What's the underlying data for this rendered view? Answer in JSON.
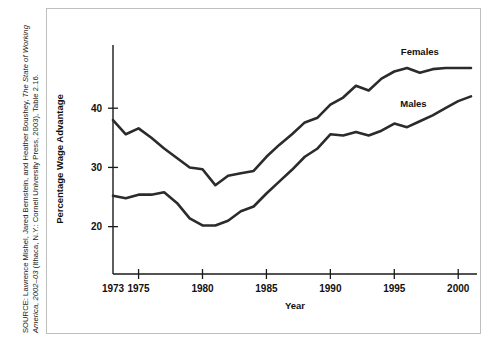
{
  "source_note": {
    "prefix": "SOURCE: Lawrence Mishel, Jared Bernstein, and Heather Boushey, ",
    "italic_1": "The State of Working America, 2002–03",
    "middle": " (Ithaca, N.Y.: Cornell University Press, 2003), Table 2.16.",
    "full_text": "SOURCE: Lawrence Mishel, Jared Bernstein, and Heather Boushey, The State of Working America, 2002–03 (Ithaca, N.Y.: Cornell University Press, 2003), Table 2.16."
  },
  "chart_data": {
    "type": "line",
    "title": "",
    "xlabel": "Year",
    "ylabel": "Percentage Wage Advantage",
    "xlim": [
      1973,
      2001
    ],
    "ylim": [
      12,
      50
    ],
    "grid": false,
    "legend_position": "inline-right",
    "xticks": [
      1973,
      1975,
      1980,
      1985,
      1990,
      1995,
      2000
    ],
    "xtick_labels": [
      "1973",
      "1975",
      "1980",
      "1985",
      "1990",
      "1995",
      "2000"
    ],
    "yticks": [
      20,
      30,
      40
    ],
    "ytick_labels": [
      "20",
      "30",
      "40"
    ],
    "x": [
      1973,
      1974,
      1975,
      1976,
      1977,
      1978,
      1979,
      1980,
      1981,
      1982,
      1983,
      1984,
      1985,
      1986,
      1987,
      1988,
      1989,
      1990,
      1991,
      1992,
      1993,
      1994,
      1995,
      1996,
      1997,
      1998,
      1999,
      2000,
      2001
    ],
    "series": [
      {
        "name": "Females",
        "label": "Females",
        "color": "#2b2b2b",
        "values": [
          38.0,
          35.6,
          36.6,
          35.0,
          33.2,
          31.6,
          30.0,
          29.7,
          27.0,
          28.6,
          29.0,
          29.4,
          31.8,
          33.8,
          35.6,
          37.6,
          38.4,
          40.6,
          41.8,
          43.8,
          43.0,
          45.0,
          46.2,
          46.8,
          46.0,
          46.6,
          46.8,
          46.8,
          46.8
        ]
      },
      {
        "name": "Males",
        "label": "Males",
        "color": "#2b2b2b",
        "values": [
          25.2,
          24.8,
          25.4,
          25.4,
          25.8,
          24.0,
          21.4,
          20.2,
          20.2,
          21.0,
          22.6,
          23.4,
          25.6,
          27.6,
          29.6,
          31.8,
          33.2,
          35.6,
          35.4,
          36.0,
          35.4,
          36.2,
          37.4,
          36.8,
          37.8,
          38.8,
          40.0,
          41.2,
          42.0
        ]
      }
    ],
    "annotations": [
      {
        "text": "Females",
        "x": 1997.0,
        "y": 49.0
      },
      {
        "text": "Males",
        "x": 1996.5,
        "y": 40.2
      }
    ]
  }
}
